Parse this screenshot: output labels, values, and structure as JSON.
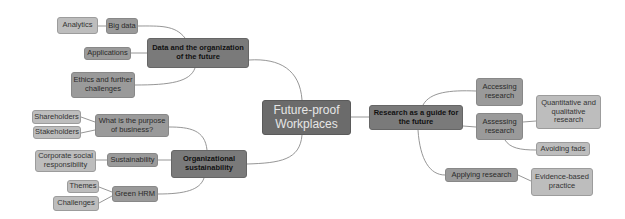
{
  "root": {
    "label": "Future-proof Workplaces"
  },
  "branches": {
    "data": {
      "label": "Data and the organization of the future",
      "children": {
        "big_data": {
          "label": "Big data",
          "child": "Analytics"
        },
        "applications": {
          "label": "Applications"
        },
        "ethics": {
          "label": "Ethics and further challenges"
        }
      }
    },
    "org": {
      "label": "Organizational sustainability",
      "children": {
        "purpose": {
          "label": "What is the purpose of business?",
          "children": [
            "Shareholders",
            "Stakeholders"
          ]
        },
        "sustainability": {
          "label": "Sustainability",
          "child": "Corporate social responsibility"
        },
        "green_hrm": {
          "label": "Green HRM",
          "children": [
            "Themes",
            "Challenges"
          ]
        }
      }
    },
    "research": {
      "label": "Research as a guide for the future",
      "children": {
        "accessing": {
          "label": "Accessing research"
        },
        "assessing": {
          "label": "Assessing research",
          "children": [
            "Quantitative and qualitative research",
            "Avoiding fads"
          ]
        },
        "applying": {
          "label": "Applying research",
          "child": "Evidence-based practice"
        }
      }
    }
  },
  "colors": {
    "root": "#6b6b6b",
    "main": "#7a7a7a",
    "level2": "#9a9a9a",
    "level3": "#bdbdbd",
    "link": "#8a8a8a"
  }
}
